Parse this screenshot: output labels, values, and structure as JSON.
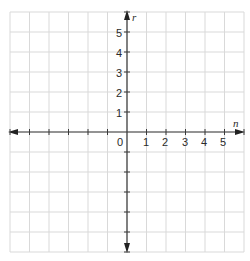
{
  "chart_data": {
    "type": "coordinate-grid",
    "title": "",
    "xlabel": "n",
    "ylabel": "r",
    "grid": true,
    "x_tick_labels": [
      "0",
      "1",
      "2",
      "3",
      "4",
      "5"
    ],
    "y_tick_labels": [
      "1",
      "2",
      "3",
      "4",
      "5"
    ],
    "origin_label": "0",
    "xlim": [
      -6,
      6
    ],
    "ylim": [
      -6,
      6
    ],
    "series": []
  },
  "colors": {
    "grid": "#d9d9d9",
    "axis": "#3a3a3a",
    "text": "#2a2a2a"
  }
}
